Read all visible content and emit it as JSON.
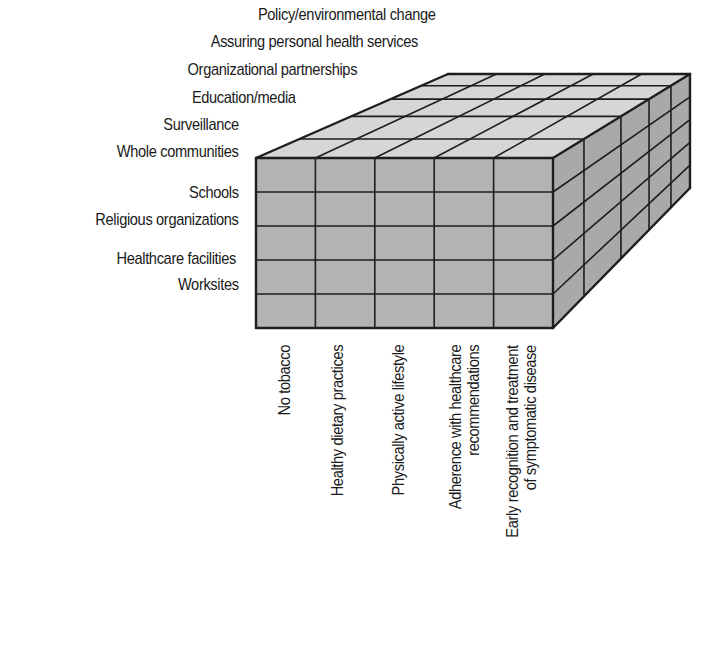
{
  "diagram": {
    "type": "3d-cube-matrix",
    "front_face_rows_label": "settings",
    "front_face_columns_label": "risk factors / behaviors",
    "depth_label": "interventions",
    "settings": [
      "Whole communities",
      "Schools",
      "Religious organizations",
      "Healthcare facilities",
      "Worksites"
    ],
    "interventions": [
      "Surveillance",
      "Education/media",
      "Organizational partnerships",
      "Assuring personal health services",
      "Policy/environmental change"
    ],
    "behaviors": [
      [
        "No tobacco"
      ],
      [
        "Healthy dietary practices"
      ],
      [
        "Physically active lifestyle"
      ],
      [
        "Adherence with healthcare",
        "recommendations"
      ],
      [
        "Early recognition and treatment",
        "of symptomatic disease"
      ]
    ],
    "colors": {
      "front_face": "#b3b3b3",
      "top_face": "#d6d6d6",
      "right_face": "#a9a9a9",
      "grid_line": "#1e1e1e",
      "text": "#1a1a1a"
    }
  }
}
